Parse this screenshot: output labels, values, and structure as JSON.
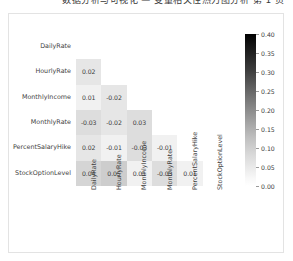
{
  "top_caption": {
    "text": "数据分析与可视化 — 变量相关性热力图分析  第 1 页"
  },
  "figure": {
    "title": "",
    "background": "#ffffff",
    "border_color": "#e3e3e3"
  },
  "chart_data": {
    "type": "heatmap",
    "title": "",
    "xlabel": "",
    "ylabel": "",
    "mask": "lower-triangle-excluding-diagonal",
    "categories": [
      "DailyRate",
      "HourlyRate",
      "MonthlyIncome",
      "MonthlyRate",
      "PercentSalaryHike",
      "StockOptionLevel"
    ],
    "row_labels": [
      "DailyRate",
      "HourlyRate",
      "MonthlyIncome",
      "MonthlyRate",
      "PercentSalaryHike",
      "StockOptionLevel"
    ],
    "col_labels": [
      "DailyRate",
      "HourlyRate",
      "MonthlyIncome",
      "MonthlyRate",
      "PercentSalaryHike",
      "StockOptionLevel"
    ],
    "annotations": true,
    "grid": false,
    "legend_position": "right",
    "colormap": "Greys",
    "colorbar": {
      "vmin": 0.0,
      "vmax": 0.4,
      "ticks": [
        0.4,
        0.35,
        0.3,
        0.25,
        0.2,
        0.15,
        0.1,
        0.05,
        0.0
      ],
      "tick_labels": [
        "0.40",
        "0.35",
        "0.30",
        "0.25",
        "0.20",
        "0.15",
        "0.10",
        "0.05",
        "0.00"
      ],
      "orientation": "vertical",
      "low_color": "#ffffff",
      "high_color": "#000000"
    },
    "cells": [
      {
        "row": 0,
        "col": 0,
        "value": null,
        "label": "",
        "shade": null
      },
      {
        "row": 1,
        "col": 0,
        "value": 0.02,
        "label": "0.02",
        "shade": 0.02
      },
      {
        "row": 2,
        "col": 0,
        "value": 0.01,
        "label": "0.01",
        "shade": 0.01
      },
      {
        "row": 2,
        "col": 1,
        "value": -0.02,
        "label": "-0.02",
        "shade": 0.02
      },
      {
        "row": 3,
        "col": 0,
        "value": -0.03,
        "label": "-0.03",
        "shade": 0.03
      },
      {
        "row": 3,
        "col": 1,
        "value": -0.02,
        "label": "-0.02",
        "shade": 0.02
      },
      {
        "row": 3,
        "col": 2,
        "value": 0.03,
        "label": "0.03",
        "shade": 0.03
      },
      {
        "row": 4,
        "col": 0,
        "value": 0.02,
        "label": "0.02",
        "shade": 0.02
      },
      {
        "row": 4,
        "col": 1,
        "value": -0.01,
        "label": "-0.01",
        "shade": 0.01
      },
      {
        "row": 4,
        "col": 2,
        "value": -0.03,
        "label": "-0.03",
        "shade": 0.03
      },
      {
        "row": 4,
        "col": 3,
        "value": -0.01,
        "label": "-0.01",
        "shade": 0.01
      },
      {
        "row": 5,
        "col": 0,
        "value": 0.04,
        "label": "0.04",
        "shade": 0.04
      },
      {
        "row": 5,
        "col": 1,
        "value": 0.05,
        "label": "0.05",
        "shade": 0.05
      },
      {
        "row": 5,
        "col": 2,
        "value": 0.01,
        "label": "0.01",
        "shade": 0.01
      },
      {
        "row": 5,
        "col": 3,
        "value": -0.03,
        "label": "-0.03",
        "shade": 0.03
      },
      {
        "row": 5,
        "col": 4,
        "value": 0.01,
        "label": "0.01",
        "shade": 0.01
      }
    ]
  }
}
